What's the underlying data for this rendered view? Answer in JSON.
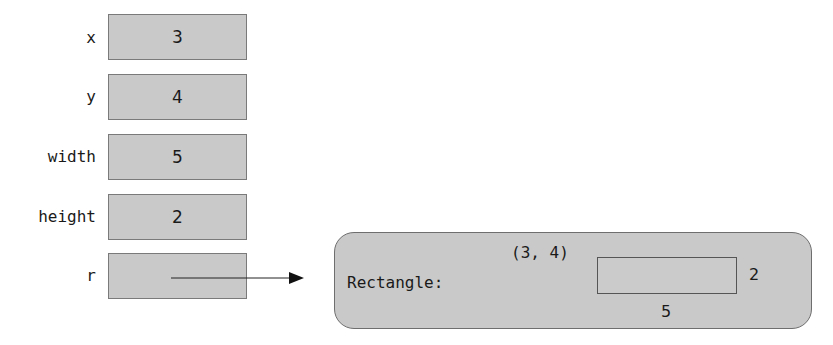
{
  "variables": [
    {
      "name": "x",
      "value": "3"
    },
    {
      "name": "y",
      "value": "4"
    },
    {
      "name": "width",
      "value": "5"
    },
    {
      "name": "height",
      "value": "2"
    },
    {
      "name": "r",
      "value": ""
    }
  ],
  "object": {
    "type_label": "Rectangle:",
    "origin": "(3, 4)",
    "width": "5",
    "height": "2"
  },
  "colors": {
    "box_fill": "#c9c9c9",
    "border": "#7a7a7a"
  }
}
